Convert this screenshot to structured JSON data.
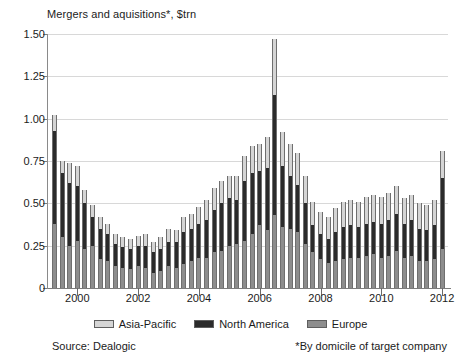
{
  "chart_data": {
    "type": "bar",
    "stacked": true,
    "title": "Mergers and aquisitions*, $trn",
    "xlabel": "",
    "ylabel": "",
    "ylim": [
      0,
      1.5
    ],
    "yticks": [
      "0",
      "0.25",
      "0.50",
      "0.75",
      "1.00",
      "1.25",
      "1.50"
    ],
    "ytick_values": [
      0,
      0.25,
      0.5,
      0.75,
      1.0,
      1.25,
      1.5
    ],
    "xticks": [
      "2000",
      "2002",
      "2004",
      "2006",
      "2008",
      "2010",
      "2012"
    ],
    "xtick_values": [
      2000,
      2002,
      2004,
      2006,
      2008,
      2010,
      2012
    ],
    "grid": true,
    "legend_position": "bottom",
    "series": [
      {
        "name": "Europe",
        "color": "#8d8d8d",
        "values": [
          0.38,
          0.3,
          0.25,
          0.28,
          0.23,
          0.25,
          0.17,
          0.16,
          0.13,
          0.12,
          0.11,
          0.13,
          0.12,
          0.09,
          0.1,
          0.13,
          0.12,
          0.14,
          0.16,
          0.18,
          0.18,
          0.21,
          0.22,
          0.25,
          0.26,
          0.28,
          0.32,
          0.37,
          0.34,
          0.43,
          0.36,
          0.35,
          0.33,
          0.26,
          0.21,
          0.17,
          0.15,
          0.16,
          0.17,
          0.18,
          0.18,
          0.19,
          0.2,
          0.18,
          0.19,
          0.22,
          0.18,
          0.19,
          0.16,
          0.16,
          0.17,
          0.23
        ]
      },
      {
        "name": "North America",
        "color": "#2b2b2b",
        "values": [
          0.55,
          0.38,
          0.37,
          0.32,
          0.27,
          0.17,
          0.18,
          0.16,
          0.13,
          0.12,
          0.12,
          0.12,
          0.13,
          0.12,
          0.13,
          0.14,
          0.15,
          0.19,
          0.19,
          0.2,
          0.22,
          0.25,
          0.28,
          0.28,
          0.26,
          0.35,
          0.36,
          0.32,
          0.37,
          0.71,
          0.36,
          0.31,
          0.28,
          0.24,
          0.16,
          0.15,
          0.14,
          0.17,
          0.19,
          0.19,
          0.18,
          0.19,
          0.19,
          0.2,
          0.21,
          0.22,
          0.2,
          0.21,
          0.19,
          0.18,
          0.2,
          0.42
        ]
      },
      {
        "name": "Asia-Pacific",
        "color": "#d5d5d5",
        "values": [
          0.09,
          0.07,
          0.12,
          0.12,
          0.08,
          0.07,
          0.07,
          0.06,
          0.06,
          0.06,
          0.06,
          0.06,
          0.07,
          0.06,
          0.07,
          0.08,
          0.07,
          0.09,
          0.09,
          0.1,
          0.12,
          0.13,
          0.13,
          0.13,
          0.14,
          0.15,
          0.16,
          0.16,
          0.18,
          0.33,
          0.2,
          0.19,
          0.19,
          0.16,
          0.14,
          0.13,
          0.13,
          0.14,
          0.15,
          0.15,
          0.15,
          0.16,
          0.16,
          0.16,
          0.16,
          0.16,
          0.15,
          0.15,
          0.15,
          0.15,
          0.15,
          0.16
        ]
      }
    ],
    "x_start_year": 1999,
    "x_start_quarter": 2,
    "period": "quarterly",
    "totals": [
      1.02,
      0.75,
      0.74,
      0.72,
      0.58,
      0.49,
      0.42,
      0.38,
      0.32,
      0.3,
      0.29,
      0.31,
      0.32,
      0.27,
      0.3,
      0.35,
      0.34,
      0.42,
      0.44,
      0.48,
      0.52,
      0.59,
      0.63,
      0.66,
      0.66,
      0.78,
      0.84,
      0.85,
      0.89,
      1.47,
      0.92,
      0.85,
      0.8,
      0.66,
      0.51,
      0.45,
      0.42,
      0.47,
      0.51,
      0.52,
      0.51,
      0.54,
      0.55,
      0.54,
      0.56,
      0.6,
      0.53,
      0.55,
      0.5,
      0.49,
      0.52,
      0.81
    ]
  },
  "legend": {
    "items": [
      {
        "label": "Asia-Pacific",
        "swatch": "sw-ap"
      },
      {
        "label": "North America",
        "swatch": "sw-na"
      },
      {
        "label": "Europe",
        "swatch": "sw-eu"
      }
    ]
  },
  "footer": {
    "source": "Source: Dealogic",
    "footnote": "*By domicile of target company"
  }
}
